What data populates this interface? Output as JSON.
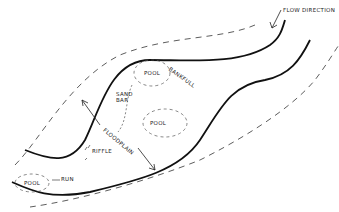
{
  "diagram": {
    "type": "river-channel-sketch",
    "labels": {
      "flow_direction": "FLOW DIRECTION",
      "pool_top": "POOL",
      "bankfull": "BANKFULL",
      "sand_bar": "SAND BAR",
      "pool_middle": "POOL",
      "floodplain": "FLOODPLAIN",
      "riffle": "RIFFLE",
      "run": "RUN",
      "pool_bottom": "POOL"
    },
    "colors": {
      "ink": "#111111",
      "background": "#ffffff"
    }
  }
}
